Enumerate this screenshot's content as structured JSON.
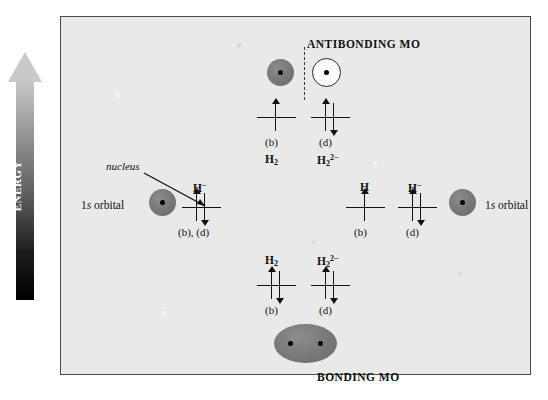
{
  "energy_axis": {
    "label": "ENERGY",
    "direction": "up"
  },
  "diagram": {
    "antibonding_title": "ANTIBONDING MO",
    "bonding_title": "BONDING MO",
    "nucleus_callout": "nucleus",
    "left_orbital_label": "1s orbital",
    "right_orbital_label": "1s orbital"
  },
  "antibonding_levels": [
    {
      "species": "H2",
      "species_html": "H<sub>2</sub>",
      "case": "(b)",
      "electrons": [
        "up"
      ]
    },
    {
      "species": "H2 2-",
      "species_html": "H<sub>2</sub><sup>2&minus;</sup>",
      "case": "(d)",
      "electrons": [
        "up",
        "down"
      ]
    }
  ],
  "bonding_levels": [
    {
      "species": "H2",
      "species_html": "H<sub>2</sub>",
      "case": "(b)",
      "electrons": [
        "up",
        "down"
      ]
    },
    {
      "species": "H2 2-",
      "species_html": "H<sub>2</sub><sup>2&minus;</sup>",
      "case": "(d)",
      "electrons": [
        "up",
        "down"
      ]
    }
  ],
  "atomic_levels_left": [
    {
      "species": "H-",
      "species_html": "H<sup>&minus;</sup>",
      "case": "(b), (d)",
      "electrons": [
        "up",
        "down"
      ]
    }
  ],
  "atomic_levels_right": [
    {
      "species": "H",
      "species_html": "H",
      "case": "(b)",
      "electrons": [
        "up"
      ]
    },
    {
      "species": "H-",
      "species_html": "H<sup>&minus;</sup>",
      "case": "(d)",
      "electrons": [
        "up",
        "down"
      ]
    }
  ],
  "colors": {
    "panel_background": "#e9e9e9",
    "panel_border": "#4a4a4a",
    "orbital_fill": "#767676",
    "orbital_open_fill": "#fbfbfb",
    "orbital_outline": "#2a2a2a",
    "nucleus": "#000000",
    "text": "#111111",
    "arrow_gradient_top": "#c8c8c8",
    "arrow_gradient_bottom": "#000000",
    "energy_label_text": "#ffffff"
  }
}
